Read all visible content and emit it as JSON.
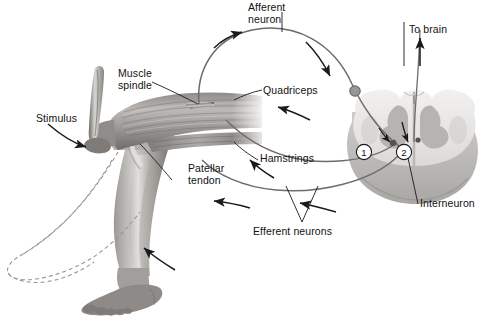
{
  "diagram": {
    "background_color": "#ffffff",
    "ink_color": "#1a1a1a",
    "tissue_light": "#e6e4e2",
    "tissue_mid": "#b9b6b3",
    "tissue_dark": "#8d8a87",
    "nerve_color": "#6f6c6a"
  },
  "labels": {
    "stimulus": "Stimulus",
    "muscle_spindle": "Muscle\nspindle",
    "patellar_tendon": "Patellar\ntendon",
    "afferent_neuron": "Afferent\nneuron",
    "quadriceps": "Quadriceps",
    "hamstrings": "Hamstrings",
    "efferent_neurons": "Efferent neurons",
    "to_brain": "To brain",
    "interneuron": "Interneuron"
  },
  "markers": {
    "one": "1",
    "two": "2"
  }
}
